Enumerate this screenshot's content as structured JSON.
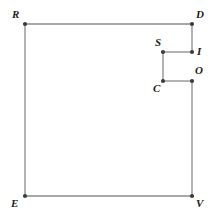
{
  "figure": {
    "background_color": "#ffffff",
    "edge_color": "#8a8a8a",
    "vertex_color": "#3b3b3b",
    "label_color": "#1c1c1c",
    "canvas": {
      "width": 221,
      "height": 217
    },
    "vertices": [
      {
        "id": "R",
        "label": "R",
        "x": 25,
        "y": 24,
        "label_x": 12,
        "label_y": 9,
        "label_anchor": "top-left"
      },
      {
        "id": "D",
        "label": "D",
        "x": 192,
        "y": 24,
        "label_x": 196,
        "label_y": 9,
        "label_anchor": "top-right"
      },
      {
        "id": "I",
        "label": "I",
        "x": 192,
        "y": 52,
        "label_x": 197,
        "label_y": 46,
        "label_anchor": "right"
      },
      {
        "id": "S",
        "label": "S",
        "x": 163,
        "y": 52,
        "label_x": 155,
        "label_y": 37,
        "label_anchor": "top-left"
      },
      {
        "id": "C",
        "label": "C",
        "x": 163,
        "y": 81,
        "label_x": 153,
        "label_y": 83,
        "label_anchor": "bottom-left"
      },
      {
        "id": "O",
        "label": "O",
        "x": 192,
        "y": 81,
        "label_x": 195,
        "label_y": 65,
        "label_anchor": "top-right"
      },
      {
        "id": "V",
        "label": "V",
        "x": 192,
        "y": 196,
        "label_x": 196,
        "label_y": 198,
        "label_anchor": "bottom-right"
      },
      {
        "id": "E",
        "label": "E",
        "x": 25,
        "y": 196,
        "label_x": 11,
        "label_y": 198,
        "label_anchor": "bottom-left"
      }
    ],
    "edges": [
      {
        "from": "R",
        "to": "D",
        "orientation": "horizontal"
      },
      {
        "from": "D",
        "to": "I",
        "orientation": "vertical"
      },
      {
        "from": "I",
        "to": "S",
        "orientation": "horizontal"
      },
      {
        "from": "S",
        "to": "C",
        "orientation": "vertical"
      },
      {
        "from": "C",
        "to": "O",
        "orientation": "horizontal"
      },
      {
        "from": "O",
        "to": "V",
        "orientation": "vertical"
      },
      {
        "from": "V",
        "to": "E",
        "orientation": "horizontal"
      },
      {
        "from": "E",
        "to": "R",
        "orientation": "vertical"
      }
    ],
    "vertex_dot_radius": 2.1,
    "edge_stroke_width": 1.3
  }
}
